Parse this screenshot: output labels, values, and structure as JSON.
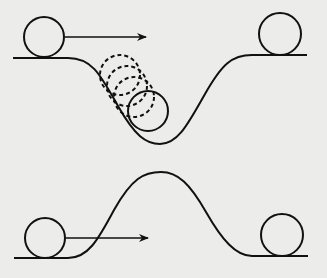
{
  "diagram": {
    "colors": {
      "background": "#ececea",
      "stroke": "#111111"
    },
    "top_panel": {
      "name": "valley",
      "track_path": "M13,58 L68,58 C92,58 100,74 118,106 C135,136 146,144 160,144 C178,144 188,124 205,94 C222,64 232,55 252,55 L307,55",
      "start_ball": {
        "cx": 44,
        "cy": 37,
        "r": 20
      },
      "arrow": {
        "x1": 65,
        "y1": 37,
        "x2": 146,
        "y2": 37
      },
      "ghost_balls": [
        {
          "cx": 120,
          "cy": 75,
          "r": 20
        },
        {
          "cx": 127,
          "cy": 86,
          "r": 20
        },
        {
          "cx": 134,
          "cy": 97,
          "r": 20
        }
      ],
      "rolling_ball": {
        "cx": 148,
        "cy": 111,
        "r": 20
      },
      "end_ball": {
        "cx": 280,
        "cy": 34,
        "r": 21
      }
    },
    "bottom_panel": {
      "name": "hill",
      "track_path": "M14,258 L68,258 C88,258 98,240 114,210 C132,178 144,172 161,172 C178,172 190,184 206,212 C222,240 236,256 252,256 L308,256",
      "start_ball": {
        "cx": 45,
        "cy": 238,
        "r": 20
      },
      "arrow": {
        "x1": 66,
        "y1": 238,
        "x2": 148,
        "y2": 238
      },
      "end_ball": {
        "cx": 282,
        "cy": 235,
        "r": 21
      }
    }
  }
}
